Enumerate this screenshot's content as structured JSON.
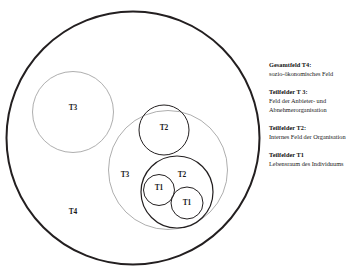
{
  "figure": {
    "name": "nested-fields-diagram",
    "circles": [
      {
        "id": "t4-outer",
        "label": "T4",
        "cx": 133,
        "cy": 138,
        "r": 126.5,
        "label_x": 73,
        "label_y": 212,
        "stroke": "#231f20",
        "stroke_width": 2.0
      },
      {
        "id": "t3-left",
        "label": "T3",
        "cx": 73,
        "cy": 112,
        "r": 40.5,
        "label_x": 73,
        "label_y": 108,
        "stroke": "#8b8b8b",
        "stroke_width": 0.7
      },
      {
        "id": "t3-right",
        "label": "T3",
        "cx": 168,
        "cy": 170,
        "r": 59.5,
        "label_x": 125,
        "label_y": 175,
        "stroke": "#8b8b8b",
        "stroke_width": 0.7
      },
      {
        "id": "t2-upper",
        "label": "T2",
        "cx": 164,
        "cy": 130,
        "r": 25.0,
        "label_x": 164,
        "label_y": 128,
        "stroke": "#231f20",
        "stroke_width": 1.0
      },
      {
        "id": "t2-lower",
        "label": "T2",
        "cx": 177,
        "cy": 192,
        "r": 36.0,
        "label_x": 182,
        "label_y": 175,
        "stroke": "#231f20",
        "stroke_width": 1.2
      },
      {
        "id": "t1-left",
        "label": "T1",
        "cx": 159,
        "cy": 190,
        "r": 15.5,
        "label_x": 159,
        "label_y": 188,
        "stroke": "#231f20",
        "stroke_width": 1.0
      },
      {
        "id": "t1-right",
        "label": "T1",
        "cx": 187,
        "cy": 203,
        "r": 16.0,
        "label_x": 187,
        "label_y": 203,
        "stroke": "#231f20",
        "stroke_width": 1.0
      }
    ]
  },
  "legend": {
    "entries": [
      {
        "title": "Gesamtfeld T4:",
        "desc": "sozio-ökonomisches Feld"
      },
      {
        "title": "Teilfelder T 3:",
        "desc": "Feld der Anbieter- und Abnehmerorganisation"
      },
      {
        "title": "Teilfelder T2:",
        "desc": "Internes Feld der Organisation"
      },
      {
        "title": "Teilfelder T1",
        "desc": "Lebensraum des Individuums"
      }
    ]
  },
  "colors": {
    "ink": "#231f20",
    "light_stroke": "#8b8b8b",
    "background": "#ffffff"
  }
}
